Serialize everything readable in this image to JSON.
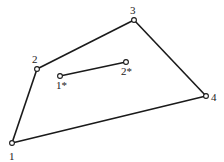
{
  "diagram": {
    "type": "linkage-graph",
    "nodes": [
      {
        "id": "1",
        "label": "1",
        "x": 12,
        "y": 143,
        "label_x": 9,
        "label_y": 160
      },
      {
        "id": "2",
        "label": "2",
        "x": 37,
        "y": 69,
        "label_x": 32,
        "label_y": 63
      },
      {
        "id": "3",
        "label": "3",
        "x": 134,
        "y": 20,
        "label_x": 130,
        "label_y": 14
      },
      {
        "id": "4",
        "label": "4",
        "x": 206,
        "y": 96,
        "label_x": 211,
        "label_y": 101
      },
      {
        "id": "1*",
        "label": "1*",
        "x": 60,
        "y": 76,
        "label_x": 56,
        "label_y": 89
      },
      {
        "id": "2*",
        "label": "2*",
        "x": 126,
        "y": 62,
        "label_x": 121,
        "label_y": 75
      }
    ],
    "edges": [
      {
        "from": "1",
        "to": "2"
      },
      {
        "from": "2",
        "to": "3"
      },
      {
        "from": "3",
        "to": "4"
      },
      {
        "from": "4",
        "to": "1"
      },
      {
        "from": "1*",
        "to": "2*"
      }
    ],
    "colors": {
      "line": "#1a1a1a",
      "node_fill": "#ffffff",
      "text": "#222222"
    }
  }
}
